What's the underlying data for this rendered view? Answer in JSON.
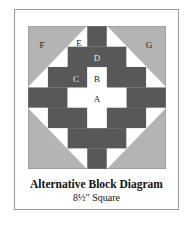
{
  "diagram": {
    "title": "Alternative Block Diagram",
    "subtitle": "8½\" Square",
    "colors": {
      "dark": "#585858",
      "corner": "#b4b4b4",
      "light": "#ffffff",
      "frame": "#9a9a9a"
    },
    "grid": {
      "rows": 7,
      "cols": 7
    },
    "labels": [
      {
        "id": "A",
        "text": "A",
        "x": 97,
        "y": 99
      },
      {
        "id": "B",
        "text": "B",
        "x": 97,
        "y": 79
      },
      {
        "id": "C",
        "text": "C",
        "x": 76,
        "y": 79
      },
      {
        "id": "D",
        "text": "D",
        "x": 97,
        "y": 58
      },
      {
        "id": "E",
        "text": "E",
        "x": 79,
        "y": 43
      },
      {
        "id": "F",
        "text": "F",
        "x": 42,
        "y": 45
      },
      {
        "id": "G",
        "text": "G",
        "x": 149,
        "y": 45
      }
    ]
  }
}
